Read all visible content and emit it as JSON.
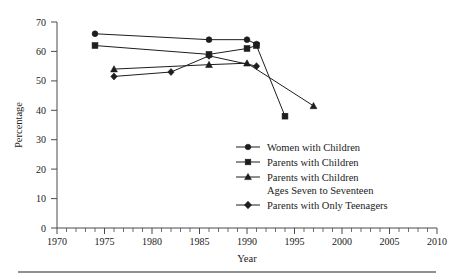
{
  "chart_data": {
    "type": "line",
    "title": "",
    "xlabel": "Year",
    "ylabel": "Percentage",
    "xlim": [
      1970,
      2010
    ],
    "ylim": [
      0,
      70
    ],
    "xticks": [
      1970,
      1975,
      1980,
      1985,
      1990,
      1995,
      2000,
      2005,
      2010
    ],
    "yticks": [
      0,
      10,
      20,
      30,
      40,
      50,
      60,
      70
    ],
    "grid": false,
    "legend_position": "inside-lower-right",
    "series": [
      {
        "name": "Women with Children",
        "marker": "circle",
        "x": [
          1974,
          1986,
          1990,
          1991
        ],
        "values": [
          66,
          64,
          64,
          62.5
        ]
      },
      {
        "name": "Parents with Children",
        "marker": "square",
        "x": [
          1974,
          1986,
          1990,
          1991,
          1994
        ],
        "values": [
          62,
          59,
          61,
          62,
          38
        ]
      },
      {
        "name": "Parents with Children Ages Seven to Seventeen",
        "marker": "triangle",
        "x": [
          1976,
          1986,
          1990,
          1997
        ],
        "values": [
          54,
          55.5,
          56,
          41.5
        ]
      },
      {
        "name": "Parents with Only Teenagers",
        "marker": "diamond",
        "x": [
          1976,
          1982,
          1986,
          1991
        ],
        "values": [
          51.5,
          53,
          58.5,
          55
        ]
      }
    ]
  },
  "legend": {
    "entries": [
      {
        "label": "Women with Children",
        "marker": "circle"
      },
      {
        "label": "Parents with Children",
        "marker": "square"
      },
      {
        "label": "Parents with Children",
        "label2": "Ages Seven to Seventeen",
        "marker": "triangle"
      },
      {
        "label": "Parents with Only Teenagers",
        "marker": "diamond"
      }
    ]
  },
  "axes": {
    "y_title": "Percentage",
    "x_title": "Year",
    "y_tick_labels": [
      "0",
      "10",
      "20",
      "30",
      "40",
      "50",
      "60",
      "70"
    ],
    "x_tick_labels": [
      "1970",
      "1975",
      "1980",
      "1985",
      "1990",
      "1995",
      "2000",
      "2005",
      "2010"
    ]
  },
  "colors": {
    "ink": "#1d1d1d",
    "axis": "#4a4a4a",
    "rule": "#6d6d6d",
    "background": "#ffffff"
  }
}
